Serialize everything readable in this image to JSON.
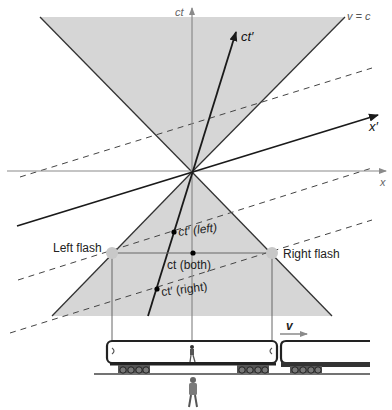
{
  "diagram": {
    "axes": {
      "ct_label": "ct",
      "x_label": "x",
      "ct_prime_label": "ct′",
      "x_prime_label": "x′",
      "light_cone_label": "v = c"
    },
    "events": {
      "left_flash_label": "Left flash",
      "right_flash_label": "Right flash",
      "ct_prime_left_label": "ct′ (left)",
      "ct_both_label": "ct (both)",
      "ct_prime_right_label": "ct′ (right)"
    },
    "train": {
      "velocity_label": "v"
    },
    "colors": {
      "cone_fill": "#d6d6d6",
      "axis": "#8a8a8a",
      "primed_axis": "#1a1a1a",
      "flash_point": "#c8c8c8",
      "dashed": "#444444"
    }
  }
}
